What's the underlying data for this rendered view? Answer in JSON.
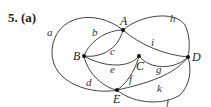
{
  "problem": {
    "label": "5. (a)"
  },
  "graph": {
    "vertices": [
      {
        "id": "A",
        "label": "A"
      },
      {
        "id": "B",
        "label": "B"
      },
      {
        "id": "C",
        "label": "C"
      },
      {
        "id": "D",
        "label": "D"
      },
      {
        "id": "E",
        "label": "E"
      }
    ],
    "edges": [
      {
        "id": "a",
        "label": "a",
        "from": "A",
        "to": "E"
      },
      {
        "id": "b",
        "label": "b",
        "from": "B",
        "to": "A"
      },
      {
        "id": "c",
        "label": "c",
        "from": "B",
        "to": "A"
      },
      {
        "id": "d",
        "label": "d",
        "from": "B",
        "to": "E"
      },
      {
        "id": "e",
        "label": "e",
        "from": "B",
        "to": "C"
      },
      {
        "id": "f",
        "label": "f",
        "from": "C",
        "to": "E"
      },
      {
        "id": "g",
        "label": "g",
        "from": "C",
        "to": "D"
      },
      {
        "id": "h",
        "label": "h",
        "from": "A",
        "to": "D"
      },
      {
        "id": "i",
        "label": "i",
        "from": "A",
        "to": "D"
      },
      {
        "id": "j",
        "label": "j",
        "from": "E",
        "to": "D"
      },
      {
        "id": "k",
        "label": "k",
        "from": "E",
        "to": "D"
      }
    ]
  }
}
